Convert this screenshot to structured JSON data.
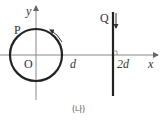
{
  "diagram": {
    "axes": {
      "x_label": "x",
      "y_label": "y",
      "origin_label": "O"
    },
    "loop": {
      "label": "P",
      "direction": "counterclockwise"
    },
    "wire": {
      "label": "Q",
      "current_direction": "down"
    },
    "ticks": [
      {
        "label": "d"
      },
      {
        "label": "2d"
      }
    ],
    "caption": "(나)"
  },
  "colors": {
    "line": "#222222",
    "axis": "#888888",
    "text": "#333333"
  }
}
